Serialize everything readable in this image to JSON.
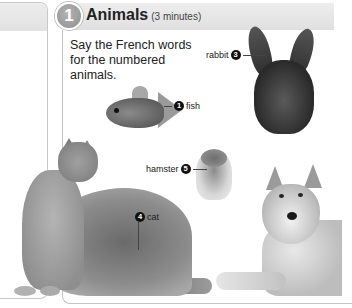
{
  "exercise": {
    "number": "1",
    "title": "Animals",
    "duration": "(3 minutes)",
    "instructions": "Say the French words for the numbered animals.",
    "accent_colors": {
      "badge": "#9e9e9e",
      "header_bar": "#e6e6e6",
      "panel_border": "#c4c4c4"
    }
  },
  "labels": [
    {
      "animal": "fish",
      "number": "1",
      "text": "fish"
    },
    {
      "animal": "rabbit",
      "number": "3",
      "text": "rabbit"
    },
    {
      "animal": "cat",
      "number": "4",
      "text": "cat"
    },
    {
      "animal": "hamster",
      "number": "5",
      "text": "hamster"
    }
  ]
}
